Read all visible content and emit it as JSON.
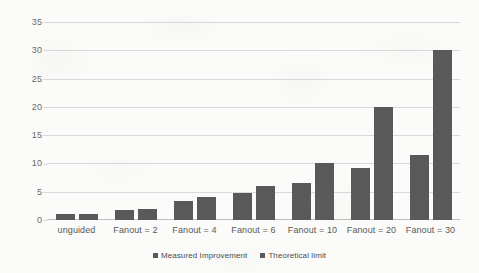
{
  "chart_data": {
    "type": "bar",
    "title": "",
    "subtitle": "",
    "xlabel": "",
    "ylabel": "",
    "categories": [
      "unguided",
      "Fanout = 2",
      "Fanout = 4",
      "Fanout = 6",
      "Fanout = 10",
      "Fanout = 20",
      "Fanout = 30"
    ],
    "series": [
      {
        "name": "Measured Improvement",
        "values": [
          1.0,
          1.8,
          3.3,
          4.7,
          6.5,
          9.2,
          11.5
        ],
        "color": "#595959"
      },
      {
        "name": "Theoretical limit",
        "values": [
          1.0,
          2.0,
          4.0,
          6.1,
          10.0,
          20.0,
          30.0
        ],
        "color": "#595959"
      }
    ],
    "ylim": [
      0,
      35
    ],
    "yticks": [
      0,
      5,
      10,
      15,
      20,
      25,
      30,
      35
    ],
    "ytick_labels": [
      "0",
      "5",
      "10",
      "15",
      "20",
      "25",
      "30",
      "35"
    ],
    "grid": true,
    "grid_axis": "y",
    "legend_position": "bottom",
    "bar_color": "#595959",
    "gridline_color": "#d9d9d9",
    "background_color": "#ffffff"
  },
  "legend": {
    "items": [
      {
        "label": "Measured Improvement",
        "swatch": "legend-swatch-measured"
      },
      {
        "label": "Theoretical limit",
        "swatch": "legend-swatch-theoretical"
      }
    ]
  }
}
